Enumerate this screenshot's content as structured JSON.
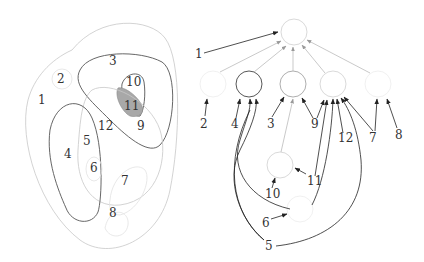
{
  "figure": {
    "left_panel": {
      "description": "Nested region (Venn-like) diagram",
      "labels": [
        {
          "id": "1",
          "text": "1",
          "x": 40,
          "y": 104
        },
        {
          "id": "2",
          "text": "2",
          "x": 61,
          "y": 82
        },
        {
          "id": "3",
          "text": "3",
          "x": 113,
          "y": 65
        },
        {
          "id": "10",
          "text": "10",
          "x": 132,
          "y": 86
        },
        {
          "id": "11",
          "text": "11",
          "x": 130,
          "y": 109
        },
        {
          "id": "12",
          "text": "12",
          "x": 104,
          "y": 129
        },
        {
          "id": "9",
          "text": "9",
          "x": 141,
          "y": 129
        },
        {
          "id": "5",
          "text": "5",
          "x": 86,
          "y": 144
        },
        {
          "id": "4",
          "text": "4",
          "x": 67,
          "y": 158
        },
        {
          "id": "6",
          "text": "6",
          "x": 93,
          "y": 171
        },
        {
          "id": "7",
          "text": "7",
          "x": 125,
          "y": 185
        },
        {
          "id": "8",
          "text": "8",
          "x": 113,
          "y": 217
        }
      ],
      "shaded_region": "11",
      "shade_color": "#a0a0a0"
    },
    "right_panel": {
      "description": "Tree / Hasse diagram of region containment",
      "labels": [
        {
          "id": "1",
          "text": "1",
          "x": 198,
          "y": 58
        },
        {
          "id": "2",
          "text": "2",
          "x": 204,
          "y": 128
        },
        {
          "id": "4",
          "text": "4",
          "x": 235,
          "y": 128
        },
        {
          "id": "3",
          "text": "3",
          "x": 271,
          "y": 128
        },
        {
          "id": "9",
          "text": "9",
          "x": 315,
          "y": 128
        },
        {
          "id": "12",
          "text": "12",
          "x": 343,
          "y": 141
        },
        {
          "id": "7",
          "text": "7",
          "x": 373,
          "y": 141
        },
        {
          "id": "8",
          "text": "8",
          "x": 398,
          "y": 138
        },
        {
          "id": "11",
          "text": "11",
          "x": 313,
          "y": 184
        },
        {
          "id": "10",
          "text": "10",
          "x": 268,
          "y": 198
        },
        {
          "id": "6",
          "text": "6",
          "x": 265,
          "y": 227
        },
        {
          "id": "5",
          "text": "5",
          "x": 269,
          "y": 250
        }
      ]
    }
  }
}
